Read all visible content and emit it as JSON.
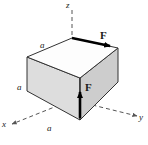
{
  "figure": {
    "type": "mechanics-diagram",
    "background_color": "#ffffff",
    "axes": {
      "z_label": "z",
      "y_label": "y",
      "x_label": "x",
      "style": "dashed",
      "color": "#555555"
    },
    "cube": {
      "edge_label": "a",
      "edge_labels": {
        "top": "a",
        "left": "a",
        "bottom": "a"
      },
      "top_face_color": "#ffffff",
      "left_face_color": "#dcdcdc",
      "right_face_color": "#cfcfcf",
      "edge_color": "#333333"
    },
    "forces": [
      {
        "name": "force-top",
        "label": "F",
        "direction": "horizontal-along-top-back-edge",
        "color": "#000000"
      },
      {
        "name": "force-front",
        "label": "F",
        "direction": "vertical-up-on-front-right-face",
        "color": "#000000"
      }
    ]
  }
}
